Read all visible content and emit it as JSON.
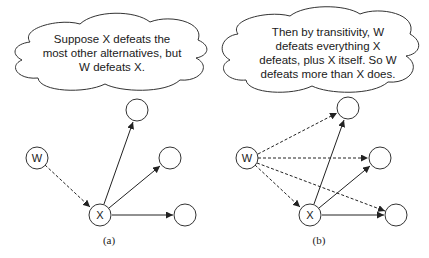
{
  "panels": [
    {
      "id": "a",
      "caption": "(a)",
      "cloud_text": "Suppose X defeats the most other alternatives, but W defeats X.",
      "nodes": [
        {
          "id": "W",
          "label": "W"
        },
        {
          "id": "X",
          "label": "X"
        },
        {
          "id": "o1",
          "label": ""
        },
        {
          "id": "o2",
          "label": ""
        },
        {
          "id": "o3",
          "label": ""
        }
      ],
      "edges": [
        {
          "from": "W",
          "to": "X",
          "style": "dashed"
        },
        {
          "from": "X",
          "to": "o1",
          "style": "solid"
        },
        {
          "from": "X",
          "to": "o2",
          "style": "solid"
        },
        {
          "from": "X",
          "to": "o3",
          "style": "solid"
        }
      ]
    },
    {
      "id": "b",
      "caption": "(b)",
      "cloud_text": "Then by transitivity, W defeats everything X defeats, plus X itself.  So W defeats more than X does.",
      "nodes": [
        {
          "id": "W",
          "label": "W"
        },
        {
          "id": "X",
          "label": "X"
        },
        {
          "id": "o1",
          "label": ""
        },
        {
          "id": "o2",
          "label": ""
        },
        {
          "id": "o3",
          "label": ""
        }
      ],
      "edges": [
        {
          "from": "W",
          "to": "X",
          "style": "dashed"
        },
        {
          "from": "W",
          "to": "o1",
          "style": "dashed"
        },
        {
          "from": "W",
          "to": "o2",
          "style": "dashed"
        },
        {
          "from": "W",
          "to": "o3",
          "style": "dashed"
        },
        {
          "from": "X",
          "to": "o1",
          "style": "solid"
        },
        {
          "from": "X",
          "to": "o2",
          "style": "solid"
        },
        {
          "from": "X",
          "to": "o3",
          "style": "solid"
        }
      ]
    }
  ]
}
